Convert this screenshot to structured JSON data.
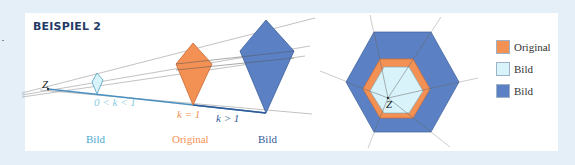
{
  "title": "BEISPIEL 2",
  "colors": {
    "original": "#f39155",
    "bild_small": "#d8f3fa",
    "bild_large": "#5b81c4",
    "title": "#243a66",
    "background": "#e4eff7"
  },
  "left_figure": {
    "center_label": "Z",
    "ratio_labels": {
      "small": "0 < k < 1",
      "equal": "k = 1",
      "large": "k > 1"
    },
    "captions": {
      "small": "Bild",
      "original": "Original",
      "large": "Bild"
    }
  },
  "right_figure": {
    "center_label": "Z"
  },
  "legend": [
    {
      "label": "Original",
      "color": "#f39155"
    },
    {
      "label": "Bild",
      "color": "#d8f3fa"
    },
    {
      "label": "Bild",
      "color": "#5b81c4"
    }
  ]
}
